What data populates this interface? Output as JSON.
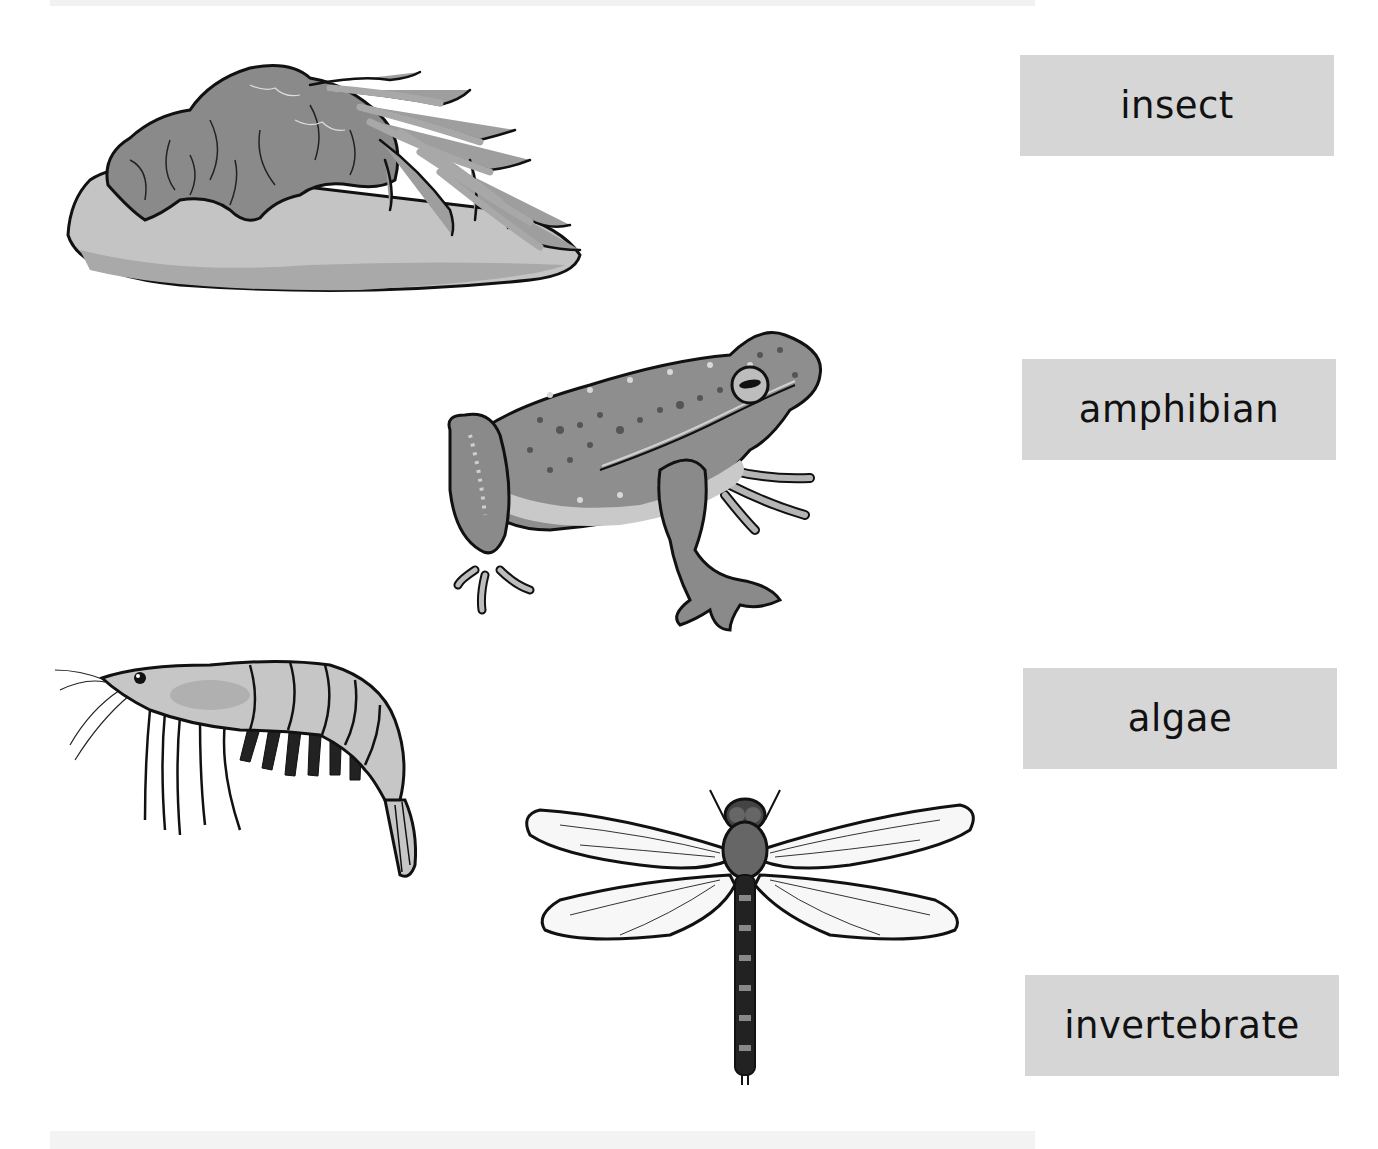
{
  "worksheet": {
    "labels": [
      {
        "id": "insect",
        "text": "insect"
      },
      {
        "id": "amphibian",
        "text": "amphibian"
      },
      {
        "id": "algae",
        "text": "algae"
      },
      {
        "id": "invertebrate",
        "text": "invertebrate"
      }
    ],
    "pictures": [
      {
        "id": "algae-on-rock",
        "icon": "algae-rock-illustration"
      },
      {
        "id": "frog",
        "icon": "frog-illustration"
      },
      {
        "id": "shrimp",
        "icon": "shrimp-illustration"
      },
      {
        "id": "dragonfly",
        "icon": "dragonfly-illustration"
      }
    ]
  },
  "colors": {
    "label_bg": "#d6d6d6",
    "label_text": "#111111",
    "outline": "#111111"
  }
}
